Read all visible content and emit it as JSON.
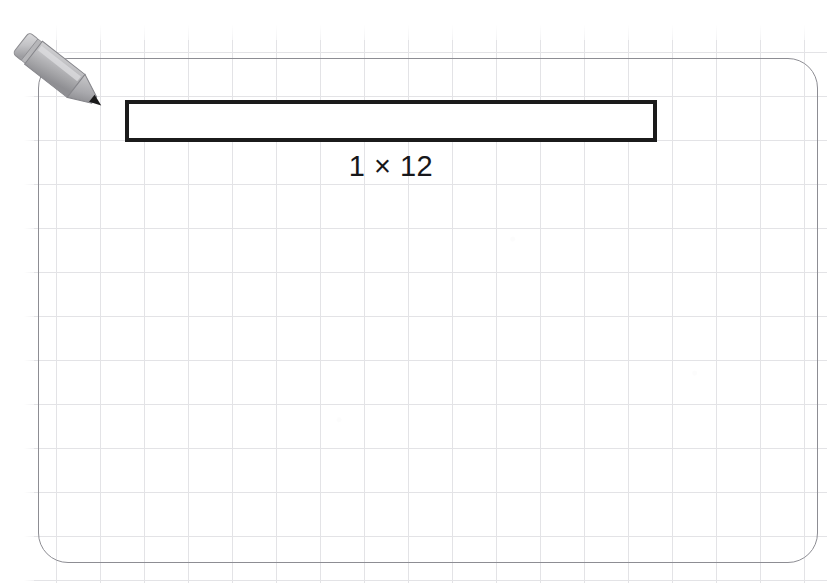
{
  "canvas": {
    "width": 827,
    "height": 583,
    "background_color": "#ffffff",
    "grid_color": "#e3e3e6",
    "grid_spacing_px": 44
  },
  "panel": {
    "name": "worksheet-panel",
    "border_color": "#8d8d93",
    "corner_radius_px": 30
  },
  "pencil": {
    "icon_name": "pencil-icon",
    "body_color": "#b4b4b6",
    "body_shade_color": "#9a9a9d",
    "tip_color": "#1b1b1b",
    "ferrule_color": "#c9c9cb"
  },
  "array": {
    "label": "1 × 12",
    "rows": 1,
    "columns": 12,
    "stroke_color": "#1b1b1b",
    "stroke_width_px": 4,
    "fill_color": "#ffffff",
    "cell_size_px": 44
  },
  "chart_data": {
    "type": "bar",
    "title": "1 × 12",
    "categories": [
      "1 × 12"
    ],
    "values": [
      12
    ],
    "xlabel": "",
    "ylabel": "",
    "ylim": [
      0,
      12
    ],
    "annotations": [
      "1 × 12"
    ],
    "layout": {
      "grid": true,
      "legend": "none",
      "orientation": "horizontal",
      "unit_cells_wide": 12,
      "unit_cells_tall": 1
    }
  }
}
